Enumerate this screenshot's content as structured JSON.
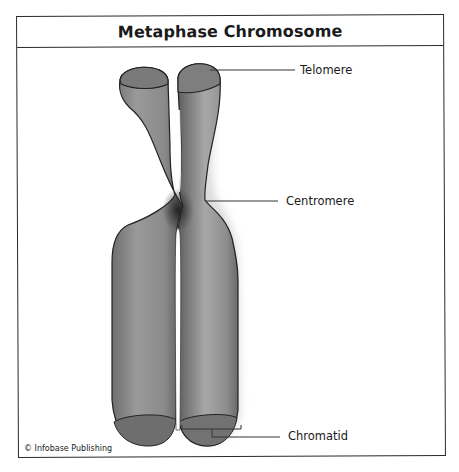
{
  "title": "Metaphase Chromosome",
  "labels": {
    "telomere": "Telomere",
    "centromere": "Centromere",
    "chromatid": "Chromatid"
  },
  "credit": "© Infobase Publishing",
  "colors": {
    "chromosome_fill": "#8a8a8a",
    "chromosome_dark": "#3a3a3a",
    "outline": "#222222",
    "frame": "#2a2a2a"
  }
}
